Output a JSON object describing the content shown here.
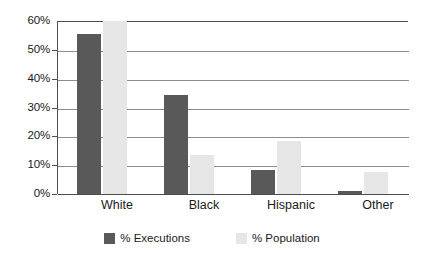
{
  "chart_data": {
    "type": "bar",
    "title": "",
    "subtitle": "",
    "xlabel": "",
    "ylabel": "",
    "categories": [
      "White",
      "Black",
      "Hispanic",
      "Other"
    ],
    "series": [
      {
        "name": "% Executions",
        "color": "#595959",
        "values": [
          55.5,
          34.5,
          8.5,
          1.0
        ]
      },
      {
        "name": "% Population",
        "color": "#e6e6e6",
        "values": [
          60.0,
          13.5,
          18.5,
          7.5
        ]
      }
    ],
    "ylim": [
      0,
      60
    ],
    "yticks": [
      0,
      10,
      20,
      30,
      40,
      50,
      60
    ],
    "ytick_labels": [
      "0%",
      "10%",
      "20%",
      "30%",
      "40%",
      "50%",
      "60%"
    ],
    "grid": true,
    "grid_axis": "y",
    "legend_position": "bottom",
    "annotations": []
  },
  "legend": {
    "items": [
      {
        "label": "% Executions",
        "swatch": "dark-gray-swatch"
      },
      {
        "label": "% Population",
        "swatch": "light-gray-swatch"
      }
    ]
  },
  "colors": {
    "executions": "#595959",
    "population": "#e6e6e6",
    "gridline": "#8c8c8c",
    "axis": "#4d4d4d",
    "text": "#1a1a1a",
    "background": "#ffffff"
  }
}
